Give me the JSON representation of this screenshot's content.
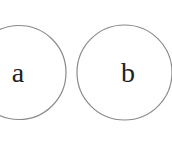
{
  "diagram": {
    "nodes": [
      {
        "id": "a",
        "label": "a",
        "cx": 19,
        "cy": 72.5,
        "r": 47
      },
      {
        "id": "b",
        "label": "b",
        "cx": 124.5,
        "cy": 72.5,
        "r": 47.5
      }
    ],
    "stroke_color": "#8a8a8a",
    "text_color": "#222222"
  }
}
